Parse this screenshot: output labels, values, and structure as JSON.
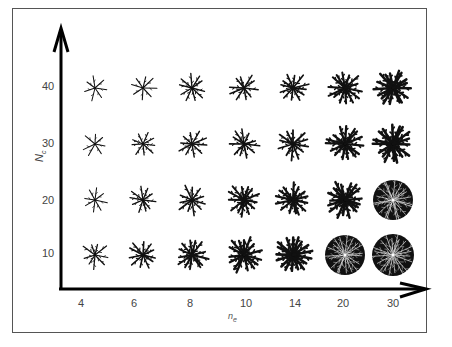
{
  "chart_data": {
    "type": "grid-of-patterns",
    "title": "",
    "xlabel": "n_e",
    "ylabel": "N_c",
    "x_ticks": [
      "4",
      "6",
      "8",
      "10",
      "14",
      "20",
      "30"
    ],
    "y_ticks": [
      "10",
      "20",
      "30",
      "40"
    ],
    "density_grid": {
      "rows_N_c": [
        40,
        30,
        20,
        10
      ],
      "cols_n_e": [
        4,
        6,
        8,
        10,
        14,
        20,
        30
      ],
      "relative_density": [
        [
          0.1,
          0.15,
          0.25,
          0.3,
          0.4,
          0.55,
          0.75
        ],
        [
          0.1,
          0.2,
          0.3,
          0.35,
          0.45,
          0.65,
          0.8
        ],
        [
          0.12,
          0.25,
          0.35,
          0.5,
          0.6,
          0.75,
          0.9
        ],
        [
          0.2,
          0.35,
          0.5,
          0.65,
          0.8,
          0.9,
          1.0
        ]
      ]
    }
  },
  "axes": {
    "x_label_main": "n",
    "x_label_sub": "e",
    "y_label_main": "N",
    "y_label_sub": "c"
  }
}
